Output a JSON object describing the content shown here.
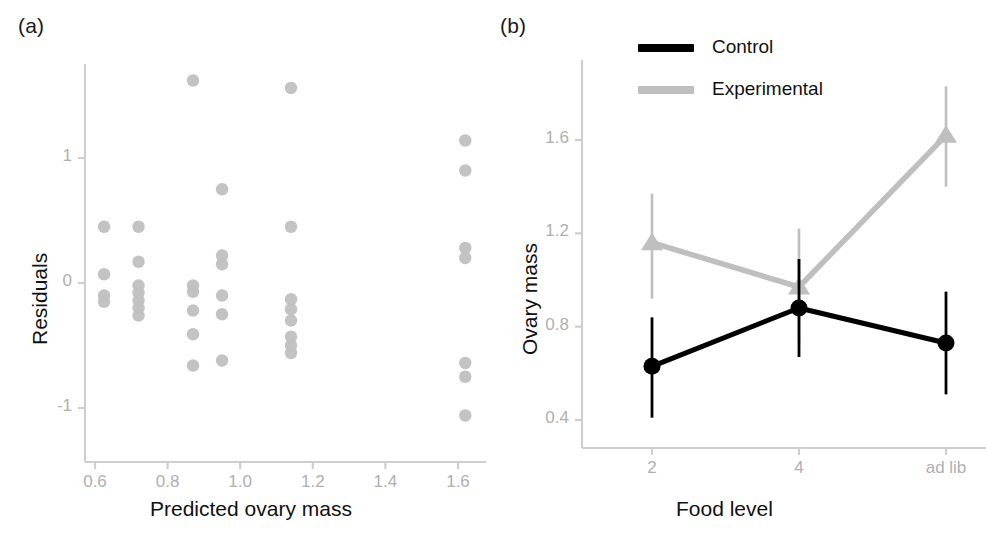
{
  "figure": {
    "panels": [
      {
        "tag": "(a)",
        "type": "scatter",
        "xlabel": "Predicted ovary mass",
        "ylabel": "Residuals"
      },
      {
        "tag": "(b)",
        "type": "line",
        "xlabel": "Food level",
        "ylabel": "Ovary mass"
      }
    ]
  },
  "colors": {
    "control": "#000000",
    "experimental": "#bfbfbf",
    "point": "#c0c0c0",
    "axis": "#cfcfcf",
    "tick_text": "#b0b0b0",
    "label_text": "#111111",
    "background": "#ffffff"
  },
  "chart_data": [
    {
      "type": "scatter",
      "panel": "(a)",
      "title": "",
      "xlabel": "Predicted ovary mass",
      "ylabel": "Residuals",
      "xticks": [
        "0.6",
        "0.8",
        "1.0",
        "1.2",
        "1.4",
        "1.6"
      ],
      "xtickvalues": [
        0.6,
        0.8,
        1.0,
        1.2,
        1.4,
        1.6
      ],
      "yticks": [
        "1",
        "0",
        "-1"
      ],
      "ytickvalues": [
        1,
        0,
        -1
      ],
      "xlim": [
        0.55,
        1.72
      ],
      "ylim": [
        -1.45,
        1.72
      ],
      "grid": false,
      "legend": "none",
      "marker": "circle",
      "points": [
        {
          "x": 0.625,
          "y": 0.45
        },
        {
          "x": 0.625,
          "y": 0.07
        },
        {
          "x": 0.625,
          "y": -0.1
        },
        {
          "x": 0.625,
          "y": -0.15
        },
        {
          "x": 0.72,
          "y": 0.45
        },
        {
          "x": 0.72,
          "y": 0.17
        },
        {
          "x": 0.72,
          "y": -0.02
        },
        {
          "x": 0.72,
          "y": -0.08
        },
        {
          "x": 0.72,
          "y": -0.14
        },
        {
          "x": 0.72,
          "y": -0.2
        },
        {
          "x": 0.72,
          "y": -0.26
        },
        {
          "x": 0.87,
          "y": 1.62
        },
        {
          "x": 0.87,
          "y": -0.02
        },
        {
          "x": 0.87,
          "y": -0.07
        },
        {
          "x": 0.87,
          "y": -0.22
        },
        {
          "x": 0.87,
          "y": -0.41
        },
        {
          "x": 0.87,
          "y": -0.66
        },
        {
          "x": 0.95,
          "y": 0.75
        },
        {
          "x": 0.95,
          "y": 0.22
        },
        {
          "x": 0.95,
          "y": 0.15
        },
        {
          "x": 0.95,
          "y": -0.1
        },
        {
          "x": 0.95,
          "y": -0.25
        },
        {
          "x": 0.95,
          "y": -0.62
        },
        {
          "x": 1.14,
          "y": 1.56
        },
        {
          "x": 1.14,
          "y": 0.45
        },
        {
          "x": 1.14,
          "y": -0.13
        },
        {
          "x": 1.14,
          "y": -0.21
        },
        {
          "x": 1.14,
          "y": -0.3
        },
        {
          "x": 1.14,
          "y": -0.43
        },
        {
          "x": 1.14,
          "y": -0.5
        },
        {
          "x": 1.14,
          "y": -0.56
        },
        {
          "x": 1.62,
          "y": 1.14
        },
        {
          "x": 1.62,
          "y": 0.9
        },
        {
          "x": 1.62,
          "y": 0.28
        },
        {
          "x": 1.62,
          "y": 0.2
        },
        {
          "x": 1.62,
          "y": -0.64
        },
        {
          "x": 1.62,
          "y": -0.75
        },
        {
          "x": 1.62,
          "y": -1.06
        }
      ]
    },
    {
      "type": "line",
      "panel": "(b)",
      "title": "",
      "xlabel": "Food level",
      "ylabel": "Ovary mass",
      "categories": [
        "2",
        "4",
        "ad lib"
      ],
      "yticks": [
        "0.4",
        "0.8",
        "1.2",
        "1.6"
      ],
      "ytickvalues": [
        0.4,
        0.8,
        1.2,
        1.6
      ],
      "ylim": [
        0.33,
        1.88
      ],
      "grid": false,
      "legend": "top-center",
      "series": [
        {
          "name": "Control",
          "color": "#000000",
          "marker": "circle",
          "values": [
            0.63,
            0.88,
            0.73
          ],
          "err_low": [
            0.41,
            0.67,
            0.51
          ],
          "err_high": [
            0.84,
            1.09,
            0.95
          ]
        },
        {
          "name": "Experimental",
          "color": "#bfbfbf",
          "marker": "triangle",
          "values": [
            1.16,
            0.97,
            1.62
          ],
          "err_low": [
            0.92,
            0.73,
            1.4
          ],
          "err_high": [
            1.37,
            1.22,
            1.83
          ]
        }
      ]
    }
  ]
}
